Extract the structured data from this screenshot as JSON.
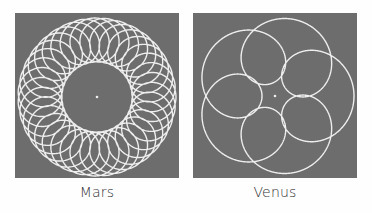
{
  "figures": [
    {
      "id": "mars",
      "label": "Mars",
      "background": "#6d6d6d",
      "stroke": "#eeeeee",
      "curve": {
        "type": "epitrochoid",
        "deferent_radius": 57,
        "epicycle_radius": 22,
        "epicycle_speed": 36,
        "loops": 35
      }
    },
    {
      "id": "venus",
      "label": "Venus",
      "background": "#6d6d6d",
      "stroke": "#eeeeee",
      "curve": {
        "type": "epitrochoid",
        "deferent_radius": 46,
        "epicycle_radius": 33,
        "epicycle_speed": 6,
        "loops": 5
      }
    }
  ]
}
